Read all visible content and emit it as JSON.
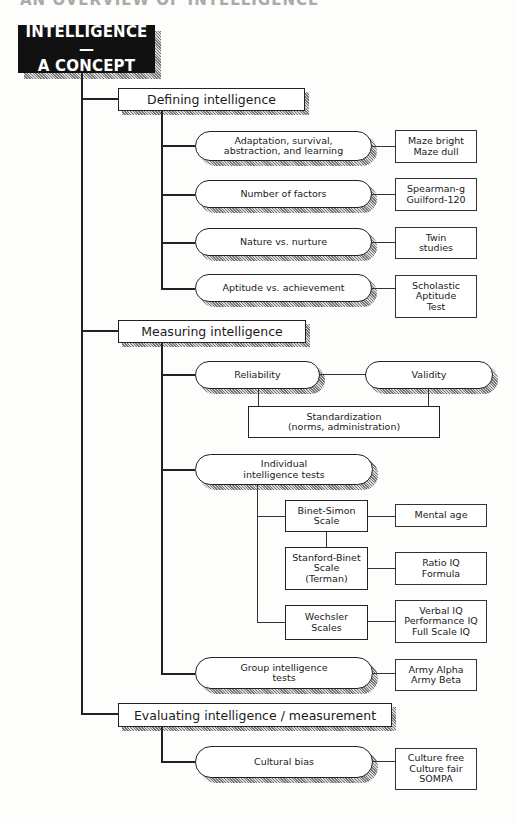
{
  "title": "AN OVERVIEW OF INTELLIGENCE",
  "root": {
    "line1": "INTELLIGENCE—",
    "line2": "A CONCEPT"
  },
  "sections": [
    {
      "label": "Defining intelligence",
      "items": [
        {
          "topic_lines": [
            "Adaptation, survival,",
            "abstraction, and learning"
          ],
          "detail_lines": [
            "Maze bright",
            "Maze dull"
          ]
        },
        {
          "topic_lines": [
            "Number of factors"
          ],
          "detail_lines": [
            "Spearman-g",
            "Guilford-120"
          ]
        },
        {
          "topic_lines": [
            "Nature vs. nurture"
          ],
          "detail_lines": [
            "Twin",
            "studies"
          ]
        },
        {
          "topic_lines": [
            "Aptitude vs. achievement"
          ],
          "detail_lines": [
            "Scholastic",
            "Aptitude",
            "Test"
          ]
        }
      ]
    },
    {
      "label": "Measuring intelligence",
      "reliability": "Reliability",
      "validity": "Validity",
      "standardization_lines": [
        "Standardization",
        "(norms, administration)"
      ],
      "individual_tests": {
        "label_lines": [
          "Individual",
          "intelligence tests"
        ],
        "tests": [
          {
            "name_lines": [
              "Binet-Simon",
              "Scale"
            ],
            "detail_lines": [
              "Mental age"
            ]
          },
          {
            "name_lines": [
              "Stanford-Binet",
              "Scale",
              "(Terman)"
            ],
            "detail_lines": [
              "Ratio IQ",
              "Formula"
            ]
          },
          {
            "name_lines": [
              "Wechsler",
              "Scales"
            ],
            "detail_lines": [
              "Verbal IQ",
              "Performance IQ",
              "Full Scale IQ"
            ]
          }
        ]
      },
      "group_tests": {
        "label_lines": [
          "Group intelligence",
          "tests"
        ],
        "detail_lines": [
          "Army Alpha",
          "Army Beta"
        ]
      }
    },
    {
      "label": "Evaluating intelligence / measurement",
      "items": [
        {
          "topic_lines": [
            "Cultural bias"
          ],
          "detail_lines": [
            "Culture free",
            "Culture fair",
            "SOMPA"
          ]
        }
      ]
    }
  ]
}
